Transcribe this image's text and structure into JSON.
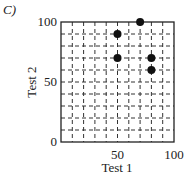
{
  "panel_label": "C)",
  "chart_data": {
    "type": "scatter",
    "title": "",
    "xlabel": "Test 1",
    "ylabel": "Test 2",
    "xlim": [
      0,
      100
    ],
    "ylim": [
      0,
      100
    ],
    "grid": true,
    "grid_step": 10,
    "xticks": [
      {
        "value": 50,
        "label": "50"
      },
      {
        "value": 100,
        "label": "100"
      }
    ],
    "yticks": [
      {
        "value": 0,
        "label": "0"
      },
      {
        "value": 50,
        "label": "50"
      },
      {
        "value": 100,
        "label": "100"
      }
    ],
    "points": [
      {
        "x": 70,
        "y": 100
      },
      {
        "x": 50,
        "y": 90
      },
      {
        "x": 50,
        "y": 70
      },
      {
        "x": 80,
        "y": 70
      },
      {
        "x": 80,
        "y": 60
      }
    ],
    "marker_color": "#111111"
  }
}
